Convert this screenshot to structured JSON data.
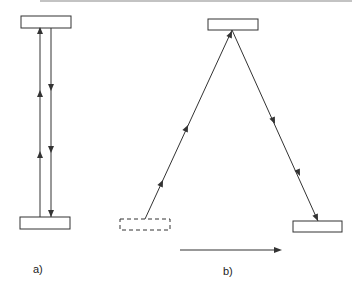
{
  "figure": {
    "panels": [
      {
        "id": "a",
        "label": "a)",
        "description": "Vertical round trip between two mirrors: upward ray and downward ray",
        "top_mirror": "solid rectangle",
        "bottom_mirror": "solid rectangle",
        "rays": [
          {
            "direction": "up",
            "arrowheads": 2
          },
          {
            "direction": "down",
            "arrowheads": 2
          }
        ]
      },
      {
        "id": "b",
        "label": "b)",
        "description": "Moving frame: ray travels diagonally up to top mirror then down to displaced bottom mirror",
        "start_mirror": "dashed rectangle (original position)",
        "top_mirror": "solid rectangle",
        "end_mirror": "solid rectangle (displaced position)",
        "motion_arrow": "horizontal arrow pointing right",
        "rays": [
          {
            "direction": "up-right",
            "arrowheads": 2
          },
          {
            "direction": "down-right",
            "arrowheads": 2
          }
        ]
      }
    ],
    "colors": {
      "stroke": "#333333",
      "top_rule": "#888888",
      "background": "#ffffff"
    }
  }
}
